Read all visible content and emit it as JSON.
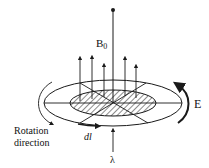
{
  "diagram": {
    "labels": {
      "field": "B",
      "field_subscript": "0",
      "electric_field": "E",
      "current_element": "dl",
      "wavelength": "λ",
      "rotation_line1": "Rotation",
      "rotation_line2": "direction"
    },
    "colors": {
      "stroke": "#1a1a1a",
      "background": "#ffffff"
    },
    "elements": {
      "field_arrows_count": 5,
      "hatched_region": "inner ellipse (cross-hatched disk)",
      "outer_ring": "outer ellipse",
      "axis": "vertical line with dot at top"
    }
  }
}
